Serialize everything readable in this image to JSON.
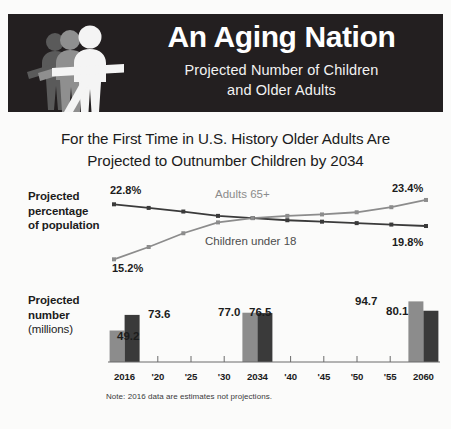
{
  "header": {
    "title": "An Aging Nation",
    "subtitle_line1": "Projected Number of Children",
    "subtitle_line2": "and Older Adults",
    "figure_icon": "three-people-icon",
    "band_color": "#231f20"
  },
  "deck": {
    "line1": "For the First Time in U.S. History Older Adults Are",
    "line2": "Projected to Outnumber Children by 2034"
  },
  "labels": {
    "line_chart_label_bold": "Projected\npercentage\nof population",
    "line_chart_label_l1": "Projected",
    "line_chart_label_l2": "percentage",
    "line_chart_label_l3": "of population",
    "bar_chart_label_l1": "Projected",
    "bar_chart_label_l2": "number",
    "bar_chart_label_l3": "(millions)"
  },
  "note": "Note: 2016 data are estimates not projections.",
  "colors": {
    "children_series": "#3a3a3a",
    "adults_series": "#8c8c8c",
    "axis": "#6b6b6b",
    "text": "#1c1c1c",
    "background": "#fbfbfa",
    "header_band": "#231f20"
  },
  "chart_data": [
    {
      "type": "line",
      "title": "Projected percentage of population",
      "xlabel": "",
      "ylabel": "Projected percentage of population",
      "x": [
        2016,
        2020,
        2025,
        2030,
        2034,
        2040,
        2045,
        2050,
        2055,
        2060
      ],
      "xtick_labels": [
        "2016",
        "'20",
        "'25",
        "'30",
        "2034",
        "'40",
        "'45",
        "'50",
        "'55",
        "2060"
      ],
      "ylim": [
        14,
        24.5
      ],
      "grid": false,
      "legend_position": "inline-annotation",
      "series": [
        {
          "name": "Children under 18",
          "color": "#3a3a3a",
          "values": [
            22.8,
            22.3,
            21.8,
            21.2,
            20.9,
            20.6,
            20.4,
            20.2,
            20.0,
            19.8
          ],
          "start_label": "22.8%",
          "end_label": "19.8%"
        },
        {
          "name": "Adults 65+",
          "color": "#8c8c8c",
          "values": [
            15.2,
            16.9,
            18.8,
            20.3,
            20.9,
            21.2,
            21.4,
            21.7,
            22.4,
            23.4
          ],
          "start_label": "15.2%",
          "end_label": "23.4%"
        }
      ],
      "annotations": [
        {
          "text": "Adults 65+",
          "color": "#8b8b8b"
        },
        {
          "text": "Children under 18",
          "color": "#4d4d4d"
        }
      ]
    },
    {
      "type": "bar",
      "title": "Projected number (millions)",
      "xlabel": "",
      "ylabel": "Projected number (millions)",
      "categories": [
        "2016",
        "'20",
        "'25",
        "'30",
        "2034",
        "'40",
        "'45",
        "'50",
        "'55",
        "2060"
      ],
      "bar_years": [
        "2016",
        "2034",
        "2060"
      ],
      "ylim": [
        0,
        100
      ],
      "grid": false,
      "series": [
        {
          "name": "Adults 65+",
          "color": "#8c8c8c",
          "categories": [
            "2016",
            "2034",
            "2060"
          ],
          "values": [
            49.2,
            77.0,
            94.7
          ],
          "labels": [
            "49.2",
            "77.0",
            "94.7"
          ]
        },
        {
          "name": "Children under 18",
          "color": "#3a3a3a",
          "categories": [
            "2016",
            "2034",
            "2060"
          ],
          "values": [
            73.6,
            76.5,
            80.1
          ],
          "labels": [
            "73.6",
            "76.5",
            "80.1"
          ]
        }
      ]
    }
  ],
  "line_values": {
    "children_start": "22.8%",
    "children_end": "19.8%",
    "adults_start": "15.2%",
    "adults_end": "23.4%",
    "adults_name": "Adults 65+",
    "children_name": "Children under 18"
  },
  "bar_values": {
    "y2016_adults": "49.2",
    "y2016_children": "73.6",
    "y2034_adults": "77.0",
    "y2034_children": "76.5",
    "y2060_adults": "94.7",
    "y2060_children": "80.1"
  },
  "xticks": [
    "2016",
    "'20",
    "'25",
    "'30",
    "2034",
    "'40",
    "'45",
    "'50",
    "'55",
    "2060"
  ]
}
